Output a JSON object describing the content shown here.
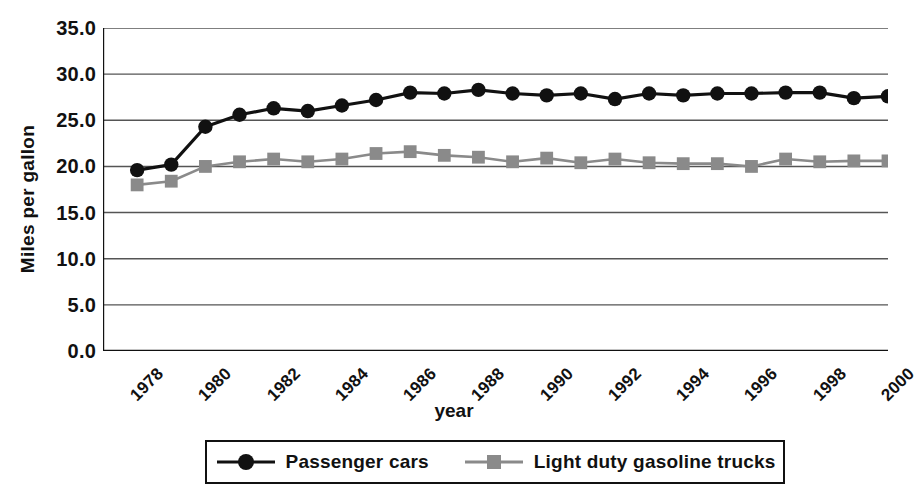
{
  "chart_data": {
    "type": "line",
    "title": "",
    "xlabel": "year",
    "ylabel": "Miles per gallon",
    "x": [
      1979,
      1980,
      1981,
      1982,
      1983,
      1984,
      1985,
      1986,
      1987,
      1988,
      1989,
      1990,
      1991,
      1992,
      1993,
      1994,
      1995,
      1996,
      1997,
      1998,
      1999,
      2000,
      2001
    ],
    "xlim": [
      1978,
      2001
    ],
    "ylim": [
      0.0,
      35.0
    ],
    "ytick_values": [
      0.0,
      5.0,
      10.0,
      15.0,
      20.0,
      25.0,
      30.0,
      35.0
    ],
    "ytick_labels": [
      "0.0",
      "5.0",
      "10.0",
      "15.0",
      "20.0",
      "25.0",
      "30.0",
      "35.0"
    ],
    "xtick_labels": [
      "1978",
      "1980",
      "1982",
      "1984",
      "1986",
      "1988",
      "1990",
      "1992",
      "1994",
      "1996",
      "1998",
      "2000"
    ],
    "xtick_label_step_years": 2,
    "xtick_minor_step_years": 1,
    "grid": "horizontal",
    "legend_position": "bottom",
    "series": [
      {
        "name": "Passenger cars",
        "color": "#111111",
        "marker": "circle",
        "values": [
          19.6,
          20.2,
          24.3,
          25.6,
          26.3,
          26.0,
          26.6,
          27.2,
          28.0,
          27.9,
          28.3,
          27.9,
          27.7,
          27.9,
          27.3,
          27.9,
          27.7,
          27.9,
          27.9,
          28.0,
          28.0,
          27.4,
          27.6
        ]
      },
      {
        "name": "Light duty gasoline trucks",
        "color": "#8a8a8a",
        "marker": "square",
        "values": [
          18.0,
          18.4,
          20.0,
          20.5,
          20.8,
          20.5,
          20.8,
          21.4,
          21.6,
          21.2,
          21.0,
          20.5,
          20.9,
          20.4,
          20.8,
          20.4,
          20.3,
          20.3,
          20.0,
          20.8,
          20.5,
          20.6,
          20.6
        ]
      }
    ]
  },
  "axis": {
    "y_title": "Miles per gallon",
    "x_title": "year"
  },
  "legend": {
    "items": [
      {
        "label": "Passenger cars",
        "marker": "circle-marker",
        "color": "#111111"
      },
      {
        "label": "Light duty gasoline trucks",
        "marker": "square-marker",
        "color": "#8a8a8a"
      }
    ]
  },
  "colors": {
    "axis": "#111111",
    "gridline": "#555555",
    "series_primary": "#111111",
    "series_secondary": "#8a8a8a",
    "background": "#ffffff"
  }
}
